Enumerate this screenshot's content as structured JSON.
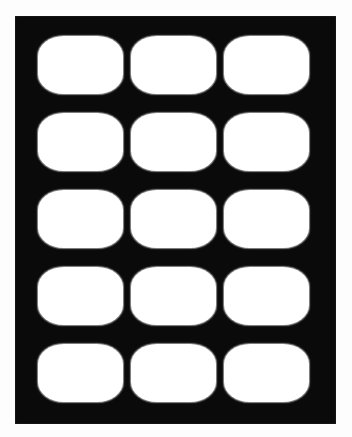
{
  "image": {
    "kind": "grid-panel-graphic",
    "background_color": "#fdfdfd",
    "width": 352,
    "height": 437
  },
  "panel": {
    "name": "black-mount-panel",
    "fill_color": "#0a0a0a",
    "x": 15,
    "y": 16,
    "width": 321,
    "height": 408
  },
  "grid": {
    "columns": 3,
    "rows": 5,
    "cell_count": 15,
    "cell_width": 85,
    "cell_height": 58,
    "column_gap": 8,
    "row_gap": 19,
    "cell_fill_color": "#ffffff",
    "cell_corner_radius": 20,
    "cell_shape": "rounded-rectangle",
    "column_left_offsets": [
      38,
      130,
      222
    ],
    "row_top_offsets": [
      36,
      117,
      192,
      270,
      350
    ],
    "cells": [
      {
        "row": 1,
        "column": 1,
        "label": ""
      },
      {
        "row": 1,
        "column": 2,
        "label": ""
      },
      {
        "row": 1,
        "column": 3,
        "label": ""
      },
      {
        "row": 2,
        "column": 1,
        "label": ""
      },
      {
        "row": 2,
        "column": 2,
        "label": ""
      },
      {
        "row": 2,
        "column": 3,
        "label": ""
      },
      {
        "row": 3,
        "column": 1,
        "label": ""
      },
      {
        "row": 3,
        "column": 2,
        "label": ""
      },
      {
        "row": 3,
        "column": 3,
        "label": ""
      },
      {
        "row": 4,
        "column": 1,
        "label": ""
      },
      {
        "row": 4,
        "column": 2,
        "label": ""
      },
      {
        "row": 4,
        "column": 3,
        "label": ""
      },
      {
        "row": 5,
        "column": 1,
        "label": ""
      },
      {
        "row": 5,
        "column": 2,
        "label": ""
      },
      {
        "row": 5,
        "column": 3,
        "label": ""
      }
    ]
  }
}
